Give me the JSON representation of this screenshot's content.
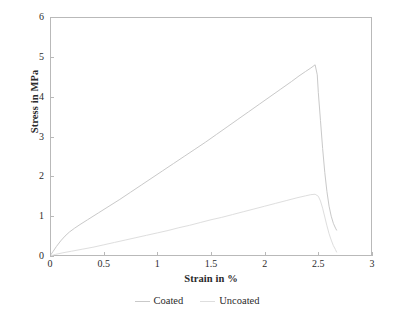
{
  "chart_data": {
    "type": "line",
    "title": "",
    "xlabel": "Strain in %",
    "ylabel": "Stress in MPa",
    "xlim": [
      0,
      3
    ],
    "ylim": [
      0,
      6
    ],
    "xticks": [
      "0",
      "0.5",
      "1",
      "1.5",
      "2",
      "2.5",
      "3"
    ],
    "xtick_values": [
      0,
      0.5,
      1,
      1.5,
      2,
      2.5,
      3
    ],
    "yticks": [
      "0",
      "1",
      "2",
      "3",
      "4",
      "5",
      "6"
    ],
    "ytick_values": [
      0,
      1,
      2,
      3,
      4,
      5,
      6
    ],
    "grid": false,
    "legend_position": "below-axis-centered",
    "frame": "full-box",
    "series": [
      {
        "name": "Coated",
        "color": "#c9c9c9",
        "peak_x": 2.47,
        "peak_y": 4.8,
        "end_x": 2.67,
        "end_y": 0.65,
        "points": [
          [
            0.0,
            0.0
          ],
          [
            0.03,
            0.12
          ],
          [
            0.06,
            0.24
          ],
          [
            0.1,
            0.38
          ],
          [
            0.14,
            0.5
          ],
          [
            0.18,
            0.6
          ],
          [
            0.23,
            0.7
          ],
          [
            0.28,
            0.79
          ],
          [
            0.35,
            0.91
          ],
          [
            0.45,
            1.08
          ],
          [
            0.55,
            1.25
          ],
          [
            0.65,
            1.42
          ],
          [
            0.75,
            1.6
          ],
          [
            0.85,
            1.78
          ],
          [
            0.95,
            1.96
          ],
          [
            1.05,
            2.14
          ],
          [
            1.15,
            2.32
          ],
          [
            1.25,
            2.5
          ],
          [
            1.35,
            2.68
          ],
          [
            1.45,
            2.86
          ],
          [
            1.55,
            3.05
          ],
          [
            1.65,
            3.24
          ],
          [
            1.75,
            3.43
          ],
          [
            1.85,
            3.62
          ],
          [
            1.95,
            3.81
          ],
          [
            2.05,
            4.0
          ],
          [
            2.15,
            4.19
          ],
          [
            2.25,
            4.38
          ],
          [
            2.32,
            4.52
          ],
          [
            2.38,
            4.63
          ],
          [
            2.43,
            4.72
          ],
          [
            2.47,
            4.8
          ],
          [
            2.49,
            4.55
          ],
          [
            2.5,
            4.1
          ],
          [
            2.52,
            3.4
          ],
          [
            2.54,
            2.7
          ],
          [
            2.56,
            2.1
          ],
          [
            2.58,
            1.62
          ],
          [
            2.6,
            1.25
          ],
          [
            2.62,
            1.0
          ],
          [
            2.64,
            0.82
          ],
          [
            2.66,
            0.7
          ],
          [
            2.67,
            0.65
          ]
        ]
      },
      {
        "name": "Uncoated",
        "color": "#dedede",
        "peak_x": 2.47,
        "peak_y": 1.55,
        "end_x": 2.67,
        "end_y": 0.1,
        "points": [
          [
            0.0,
            0.0
          ],
          [
            0.05,
            0.04
          ],
          [
            0.12,
            0.08
          ],
          [
            0.2,
            0.12
          ],
          [
            0.3,
            0.17
          ],
          [
            0.4,
            0.22
          ],
          [
            0.5,
            0.28
          ],
          [
            0.6,
            0.34
          ],
          [
            0.7,
            0.4
          ],
          [
            0.8,
            0.46
          ],
          [
            0.9,
            0.52
          ],
          [
            1.0,
            0.58
          ],
          [
            1.1,
            0.64
          ],
          [
            1.2,
            0.71
          ],
          [
            1.3,
            0.77
          ],
          [
            1.4,
            0.84
          ],
          [
            1.5,
            0.91
          ],
          [
            1.6,
            0.97
          ],
          [
            1.7,
            1.04
          ],
          [
            1.8,
            1.11
          ],
          [
            1.9,
            1.18
          ],
          [
            2.0,
            1.25
          ],
          [
            2.1,
            1.32
          ],
          [
            2.2,
            1.39
          ],
          [
            2.3,
            1.46
          ],
          [
            2.38,
            1.51
          ],
          [
            2.43,
            1.54
          ],
          [
            2.47,
            1.55
          ],
          [
            2.5,
            1.5
          ],
          [
            2.52,
            1.38
          ],
          [
            2.54,
            1.2
          ],
          [
            2.56,
            0.98
          ],
          [
            2.58,
            0.76
          ],
          [
            2.6,
            0.56
          ],
          [
            2.62,
            0.4
          ],
          [
            2.64,
            0.26
          ],
          [
            2.66,
            0.16
          ],
          [
            2.67,
            0.1
          ]
        ]
      }
    ]
  },
  "axes": {
    "y_title": "Stress in MPa",
    "x_title": "Strain in %",
    "y_labels": [
      "6",
      "5",
      "4",
      "3",
      "2",
      "1",
      "0"
    ],
    "x_labels": [
      "0",
      "0.5",
      "1",
      "1.5",
      "2",
      "2.5",
      "3"
    ]
  },
  "legend": {
    "items": [
      {
        "label": "Coated",
        "color": "#c9c9c9"
      },
      {
        "label": "Uncoated",
        "color": "#dedede"
      }
    ]
  }
}
